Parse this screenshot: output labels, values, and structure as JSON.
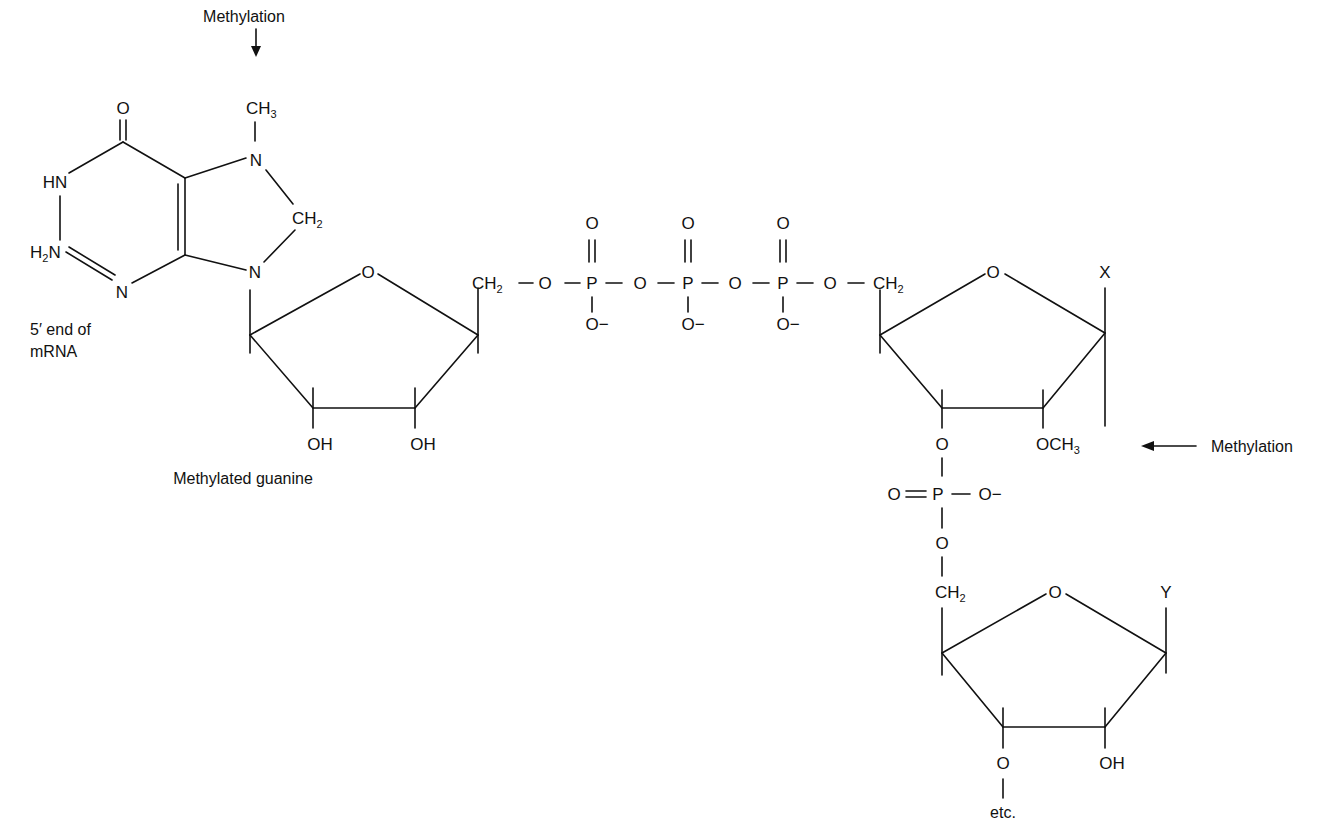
{
  "annotations": {
    "methylation_top": "Methylation",
    "methylation_right": "Methylation",
    "five_prime_line1": "5′ end of",
    "five_prime_line2": "mRNA",
    "methylated_guanine": "Methylated guanine",
    "etc": "etc."
  },
  "guanine": {
    "carbonyl_o": "O",
    "hn": "HN",
    "h2n_h": "H",
    "h2n_sub": "2",
    "h2n_n": "N",
    "ring_n": "N",
    "n7": "N",
    "n9": "N",
    "ch3_c": "CH",
    "ch3_sub": "3",
    "ch2_c": "CH",
    "ch2_sub": "2"
  },
  "sugar1": {
    "ring_o": "O",
    "oh_2": "OH",
    "oh_3": "OH",
    "ch2_c": "CH",
    "ch2_sub": "2"
  },
  "triphosphate": {
    "bridge_o": [
      "O",
      "O",
      "O",
      "O"
    ],
    "p": [
      "P",
      "P",
      "P"
    ],
    "double_o": [
      "O",
      "O",
      "O"
    ],
    "neg_o": [
      "O−",
      "O−",
      "O−"
    ],
    "ch2_c": "CH",
    "ch2_sub": "2"
  },
  "sugar2": {
    "ring_o": "O",
    "base": "X",
    "o3": "O",
    "och3_c": "OCH",
    "och3_sub": "3"
  },
  "phosphodiester": {
    "double_o": "O",
    "p": "P",
    "neg_o": "O−",
    "o5": "O",
    "ch2_c": "CH",
    "ch2_sub": "2"
  },
  "sugar3": {
    "ring_o": "O",
    "base": "Y",
    "o3": "O",
    "oh": "OH"
  },
  "colors": {
    "ink": "#111111",
    "background": "#ffffff"
  }
}
